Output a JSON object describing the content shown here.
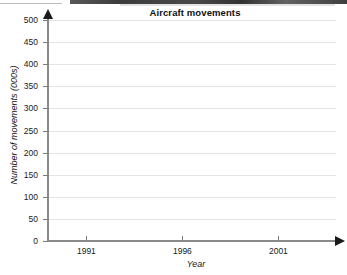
{
  "chart_data": {
    "type": "line",
    "title": "Aircraft movements",
    "xlabel": "Year",
    "ylabel": "Number of movements (000s)",
    "xlim": [
      1989,
      2004
    ],
    "ylim": [
      0,
      500
    ],
    "x_ticks": [
      1991,
      1996,
      2001
    ],
    "x_tick_labels": [
      "1991",
      "1996",
      "2001"
    ],
    "y_ticks": [
      0,
      50,
      100,
      150,
      200,
      250,
      300,
      350,
      400,
      450,
      500
    ],
    "y_tick_labels": [
      "0",
      "50",
      "100",
      "150",
      "200",
      "250",
      "300",
      "350",
      "400",
      "450",
      "500"
    ],
    "grid": true,
    "grid_axis": "y",
    "legend": null,
    "series": [],
    "values": [],
    "categories": [],
    "note": "Blank plotting grid - no data series drawn"
  },
  "style": {
    "grid_color": "#e4e4e4",
    "axis_color": "#8a8a8a",
    "arrow_color": "#1a1a1a",
    "text_color": "#1a1a1a",
    "background": "#ffffff"
  }
}
